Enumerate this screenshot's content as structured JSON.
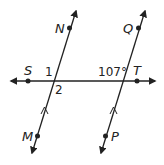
{
  "diagram": {
    "type": "parallel-lines-transversal",
    "horizontal_line": {
      "points": [
        {
          "label": "S",
          "x": 28,
          "y": 81
        },
        {
          "label": "T",
          "x": 137,
          "y": 81
        }
      ]
    },
    "left_line": {
      "points": [
        {
          "label": "N",
          "x": 69,
          "y": 28
        },
        {
          "label": "M",
          "x": 37,
          "y": 136
        }
      ],
      "parallel_marker": true
    },
    "right_line": {
      "points": [
        {
          "label": "Q",
          "x": 138,
          "y": 28
        },
        {
          "label": "P",
          "x": 105,
          "y": 136
        }
      ],
      "parallel_marker": true
    },
    "angle_labels": {
      "angle1": "1",
      "angle2": "2",
      "given_angle": "107°"
    },
    "labels": {
      "S": "S",
      "T": "T",
      "N": "N",
      "M": "M",
      "Q": "Q",
      "P": "P"
    },
    "colors": {
      "line": "#222222",
      "background": "#ffffff"
    }
  }
}
